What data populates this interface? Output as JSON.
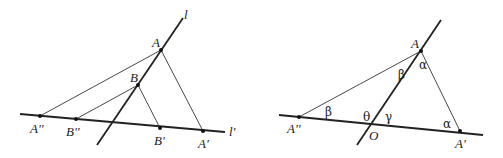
{
  "figures": [
    {
      "id": "left",
      "lines": {
        "l": {
          "label": "l",
          "from": [
            97,
            145
          ],
          "to": [
            183,
            18
          ]
        },
        "l_prime": {
          "label": "l'",
          "from": [
            20,
            114
          ],
          "to": [
            225,
            132
          ]
        }
      },
      "points": {
        "A": {
          "label": "A",
          "xy": [
            161,
            50
          ]
        },
        "B": {
          "label": "B",
          "xy": [
            138,
            85
          ]
        },
        "A_dd": {
          "label": "A''",
          "xy": [
            40,
            116
          ]
        },
        "B_dd": {
          "label": "B''",
          "xy": [
            76,
            119
          ]
        },
        "B_p": {
          "label": "B'",
          "xy": [
            160,
            128
          ]
        },
        "A_p": {
          "label": "A'",
          "xy": [
            203,
            131
          ]
        }
      }
    },
    {
      "id": "right",
      "lines": {
        "l": {
          "from": [
            357,
            145
          ],
          "to": [
            441,
            20
          ]
        },
        "l_prime": {
          "from": [
            279,
            115
          ],
          "to": [
            483,
            135
          ]
        }
      },
      "points": {
        "A": {
          "label": "A",
          "xy": [
            421,
            51
          ]
        },
        "A_dd": {
          "label": "A''",
          "xy": [
            299,
            117
          ]
        },
        "O": {
          "label": "O",
          "xy": [
            374,
            124
          ]
        },
        "A_p": {
          "label": "A'",
          "xy": [
            460,
            131
          ]
        }
      },
      "angles": {
        "alpha_at_A": "α",
        "beta_at_A": "β",
        "beta_at_A_dd": "β",
        "theta_at_O": "θ",
        "gamma_at_O": "γ",
        "alpha_at_A_p": "α"
      }
    }
  ]
}
